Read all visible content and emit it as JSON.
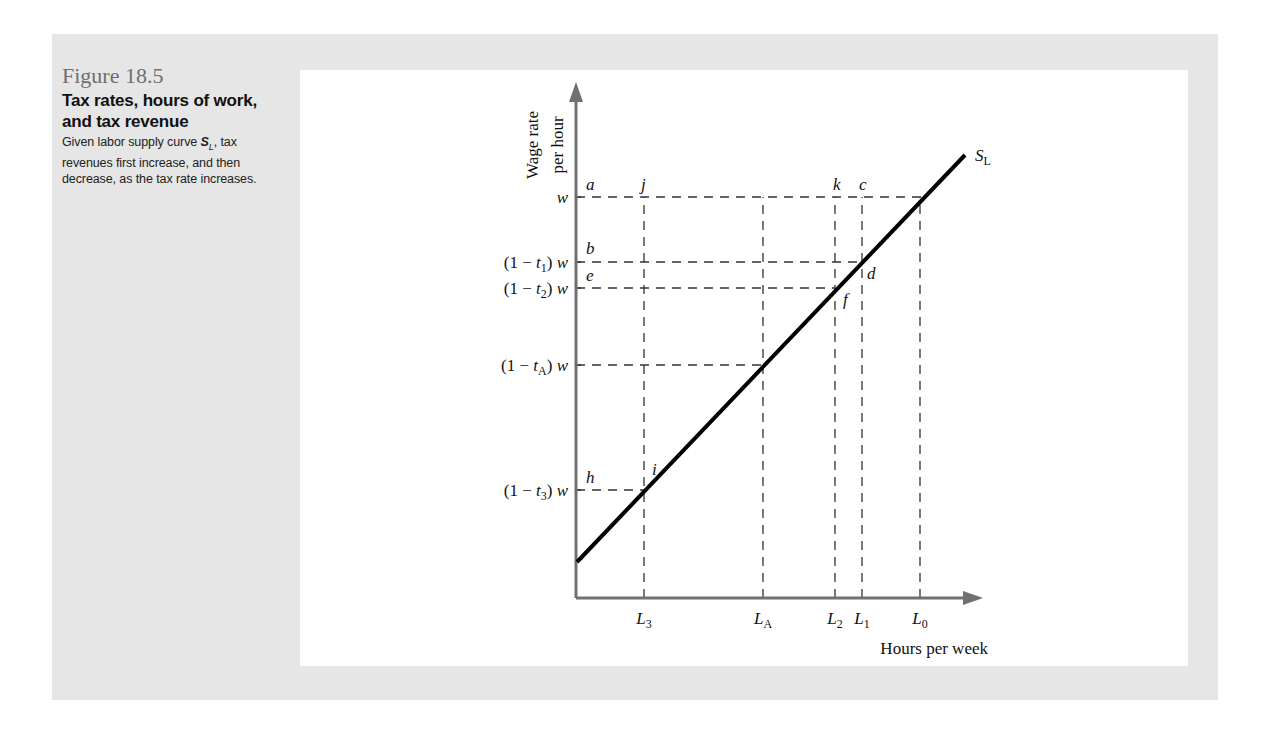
{
  "caption": {
    "figure_number": "Figure 18.5",
    "title": "Tax rates, hours of work, and tax revenue",
    "description_pre": "Given labor supply curve ",
    "description_sym": "S",
    "description_sub": "L",
    "description_post": ", tax revenues first increase, and then decrease, as the tax rate increases."
  },
  "chart_data": {
    "type": "line",
    "title": "Tax rates, hours of work, and tax revenue",
    "xlabel": "Hours per week",
    "ylabel": "Wage rate per hour",
    "grid": false,
    "legend": null,
    "curve": {
      "name": "S_L",
      "label": "S",
      "label_sub": "L",
      "from": [
        577,
        562
      ],
      "to": [
        965,
        155
      ]
    },
    "axes": {
      "origin": [
        576,
        598
      ],
      "x_end": 983,
      "y_end": 82
    },
    "y_levels": [
      {
        "id": "w",
        "label": "w",
        "y": 197,
        "point_label": "a"
      },
      {
        "id": "t1",
        "label": "(1 − t",
        "sub": "1",
        "suffix": ") w",
        "y": 262,
        "point_label": "b"
      },
      {
        "id": "t2",
        "label": "(1 − t",
        "sub": "2",
        "suffix": ") w",
        "y": 288,
        "point_label": "e"
      },
      {
        "id": "tA",
        "label": "(1 − t",
        "sub": "A",
        "suffix": ") w",
        "y": 365,
        "point_label": ""
      },
      {
        "id": "t3",
        "label": "(1 − t",
        "sub": "3",
        "suffix": ") w",
        "y": 490,
        "point_label": "h"
      }
    ],
    "x_levels": [
      {
        "id": "L3",
        "label": "L",
        "sub": "3",
        "x": 644
      },
      {
        "id": "LA",
        "label": "L",
        "sub": "A",
        "x": 763
      },
      {
        "id": "L2",
        "label": "L",
        "sub": "2",
        "x": 835
      },
      {
        "id": "L1",
        "label": "L",
        "sub": "1",
        "x": 862
      },
      {
        "id": "L0",
        "label": "L",
        "sub": "0",
        "x": 920
      }
    ],
    "point_labels": [
      {
        "text": "a",
        "x": 586,
        "y": 190
      },
      {
        "text": "j",
        "x": 641,
        "y": 190
      },
      {
        "text": "k",
        "x": 833,
        "y": 190
      },
      {
        "text": "c",
        "x": 859,
        "y": 190
      },
      {
        "text": "b",
        "x": 586,
        "y": 254
      },
      {
        "text": "e",
        "x": 586,
        "y": 281
      },
      {
        "text": "d",
        "x": 867,
        "y": 279
      },
      {
        "text": "f",
        "x": 843,
        "y": 305
      },
      {
        "text": "i",
        "x": 652,
        "y": 475
      },
      {
        "text": "h",
        "x": 586,
        "y": 483
      }
    ]
  }
}
